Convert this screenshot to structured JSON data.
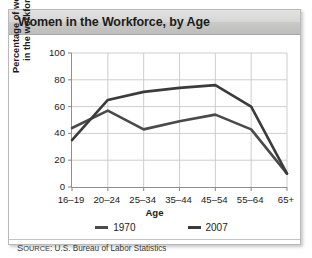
{
  "card": {
    "title": "Women in the Workforce, by Age"
  },
  "source": {
    "label_lead": "S",
    "label_rest": "OURCE",
    "text": ": U.S. Bureau of Labor Statistics",
    "full": "SOURCE: U.S. Bureau of Labor Statistics"
  },
  "chart_data": {
    "type": "line",
    "title": "Women in the Workforce, by Age",
    "xlabel": "Age",
    "ylabel": "Percentage of women\nin the workforce",
    "categories": [
      "16–19",
      "20–24",
      "25–34",
      "35–44",
      "45–54",
      "55–64",
      "65+"
    ],
    "yticks": [
      0,
      20,
      40,
      60,
      80,
      100
    ],
    "ylim": [
      0,
      100
    ],
    "grid": true,
    "legend_position": "bottom",
    "markers": false,
    "line_color": "#3b3b3b",
    "series": [
      {
        "name": "1970",
        "color": "#4a4a4a",
        "values": [
          44,
          57,
          43,
          49,
          54,
          43,
          10
        ]
      },
      {
        "name": "2007",
        "color": "#3b3b3b",
        "values": [
          35,
          65,
          71,
          74,
          76,
          60,
          10
        ]
      }
    ]
  }
}
